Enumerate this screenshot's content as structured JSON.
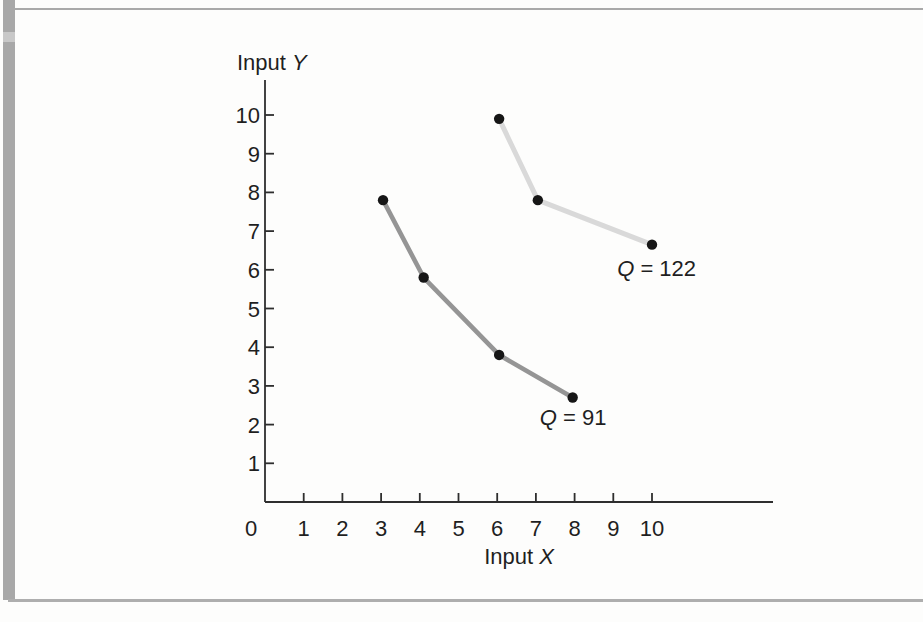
{
  "page": {
    "background": "#fdfdfc",
    "edge_strip_color": "#a8a8a8",
    "edge_strip_notch_color": "#c8c8c8",
    "top_rule_color": "#a9a9a9",
    "bottom_rule_color": "#aeaeae"
  },
  "chart_data": {
    "type": "line",
    "title": "",
    "xlabel": "Input X",
    "ylabel": "Input Y",
    "x_ticks": [
      0,
      1,
      2,
      3,
      4,
      5,
      6,
      7,
      8,
      9,
      10
    ],
    "y_ticks": [
      1,
      2,
      3,
      4,
      5,
      6,
      7,
      8,
      9,
      10
    ],
    "xlim": [
      0,
      13.1
    ],
    "ylim": [
      0,
      10.9
    ],
    "grid": false,
    "legend": "inline-curve-labels",
    "axis_color": "#2e2e2e",
    "text_color": "#1f1f1f",
    "point_color": "#161616",
    "series": [
      {
        "name": "Q = 91",
        "label_italic": "Q",
        "label_rest": " = 91",
        "color": "#959595",
        "line_width": 4.6,
        "points": [
          [
            3.05,
            7.8
          ],
          [
            4.1,
            5.8
          ],
          [
            6.05,
            3.8
          ],
          [
            7.95,
            2.7
          ]
        ],
        "label_anchor": [
          7.1,
          2.0
        ]
      },
      {
        "name": "Q = 122",
        "label_italic": "Q",
        "label_rest": " = 122",
        "color": "#d9d9d9",
        "line_width": 5.0,
        "points": [
          [
            6.05,
            9.9
          ],
          [
            7.05,
            7.8
          ],
          [
            10.0,
            6.65
          ]
        ],
        "label_anchor": [
          9.1,
          5.85
        ]
      }
    ]
  }
}
